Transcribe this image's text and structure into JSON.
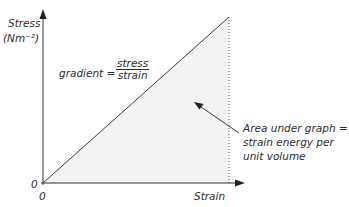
{
  "diagram": {
    "type": "stress-strain graph",
    "y_axis": {
      "label": "Stress",
      "unit": "(Nm⁻²)",
      "origin_label": "0"
    },
    "x_axis": {
      "label": "Strain",
      "origin_label": "0"
    },
    "gradient_label": "gradient =",
    "gradient_fraction": {
      "numerator": "stress",
      "denominator": "strain"
    },
    "annotation": {
      "lines": [
        "Area under graph =",
        "strain energy per",
        "unit volume"
      ]
    },
    "colors": {
      "line": "#3a3a3a",
      "shaded_area": "#f3f3f3",
      "text": "#2a2a2a"
    }
  }
}
